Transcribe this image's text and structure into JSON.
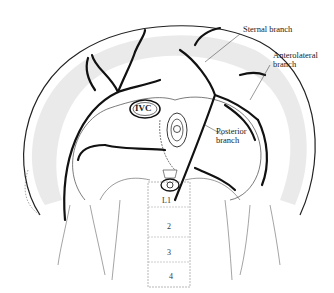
{
  "figure": {
    "labels": {
      "sternal": "Sternal branch",
      "anterolateral_1": "Anterolateral",
      "anterolateral_2": "branch",
      "posterior_1": "Posterior",
      "posterior_2": "branch",
      "ivc": "IVC"
    },
    "vertebrae": [
      "L1",
      "2",
      "3",
      "4"
    ],
    "colors": {
      "ink": "#111111",
      "hatch": "#888888",
      "background": "#ffffff"
    }
  }
}
